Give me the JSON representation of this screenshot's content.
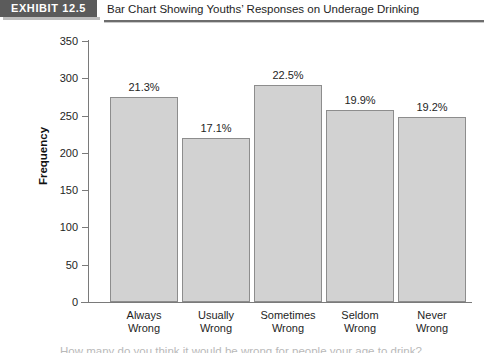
{
  "header": {
    "exhibit_badge": "EXHIBIT 12.5",
    "title": "Bar Chart Showing Youths’ Responses on Underage Drinking"
  },
  "clipped_caption": "How many do you think it would be wrong for people your age to drink?",
  "chart_data": {
    "type": "bar",
    "title": "Bar Chart Showing Youths’ Responses on Underage Drinking",
    "xlabel": "",
    "ylabel": "Frequency",
    "ylim": [
      0,
      350
    ],
    "ytick_step": 50,
    "yticks": [
      "350",
      "300",
      "250",
      "200",
      "150",
      "100",
      "50",
      "0"
    ],
    "grid": false,
    "legend": "none",
    "categories": [
      "Always Wrong",
      "Usually Wrong",
      "Sometimes Wrong",
      "Seldom Wrong",
      "Never Wrong"
    ],
    "category_lines": [
      [
        "Always",
        "Wrong"
      ],
      [
        "Usually",
        "Wrong"
      ],
      [
        "Sometimes",
        "Wrong"
      ],
      [
        "Seldom",
        "Wrong"
      ],
      [
        "Never",
        "Wrong"
      ]
    ],
    "values": [
      275,
      220,
      291,
      257,
      248
    ],
    "data_labels": [
      "21.3%",
      "17.1%",
      "22.5%",
      "19.9%",
      "19.2%"
    ],
    "bar_color": "#d2d2d2",
    "bar_border_color": "#8d8d8d"
  }
}
